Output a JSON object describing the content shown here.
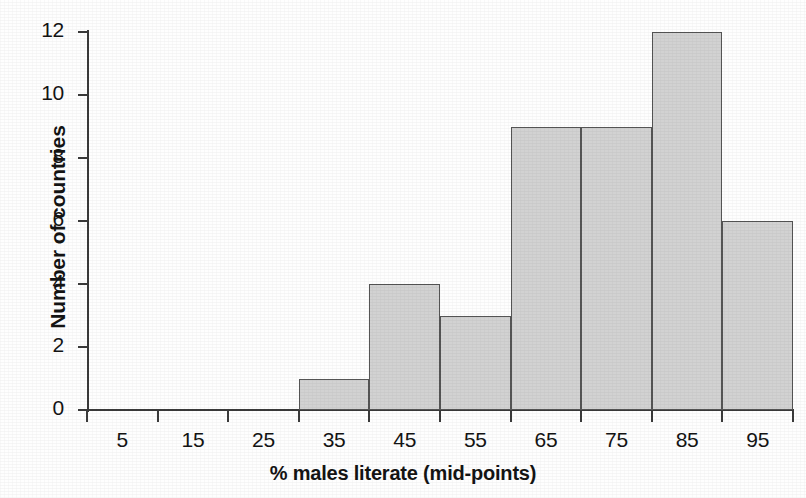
{
  "chart_data": {
    "type": "bar",
    "title": "",
    "subtitle": "",
    "xlabel": "% males literate (mid-points)",
    "ylabel": "Number of countries",
    "categories": [
      "5",
      "15",
      "25",
      "35",
      "45",
      "55",
      "65",
      "75",
      "85",
      "95"
    ],
    "values": [
      0,
      0,
      0,
      1,
      4,
      3,
      9,
      9,
      12,
      6
    ],
    "series": [
      {
        "name": "Number of countries",
        "values": [
          0,
          0,
          0,
          1,
          4,
          3,
          9,
          9,
          12,
          6
        ]
      }
    ],
    "bin_edges": [
      0,
      10,
      20,
      30,
      40,
      50,
      60,
      70,
      80,
      90,
      100
    ],
    "xlim": [
      0,
      100
    ],
    "ylim": [
      0,
      12
    ],
    "ytick_labels": [
      "0",
      "2",
      "4",
      "6",
      "8",
      "10",
      "12"
    ],
    "ytick_values": [
      0,
      2,
      4,
      6,
      8,
      10,
      12
    ],
    "xtick_labels": [
      "5",
      "15",
      "25",
      "35",
      "45",
      "55",
      "65",
      "75",
      "85",
      "95"
    ],
    "grid": false,
    "legend": false,
    "legend_position": "none",
    "bar_fill_color": "#d2d2d2",
    "bar_edge_color": "#555555",
    "axis_color": "#3a3a3a",
    "text_color": "#141414",
    "background_color": "#fefefe",
    "annotations": []
  }
}
